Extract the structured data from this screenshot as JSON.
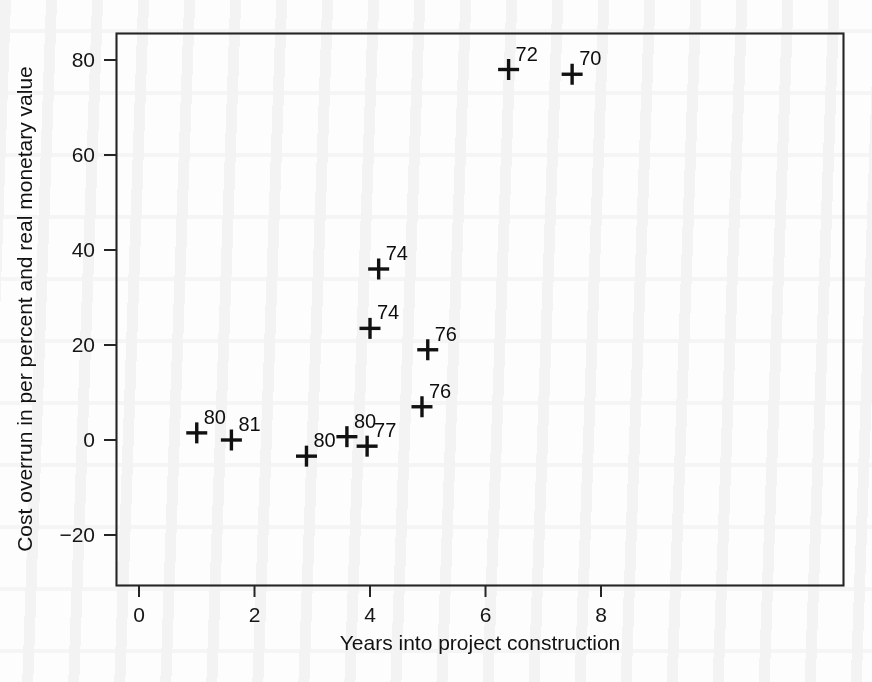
{
  "chart_data": {
    "type": "scatter",
    "title": "",
    "xlabel": "Years into project construction",
    "ylabel": "Cost overrun in per percent and real monetary value",
    "xlim": [
      -0.6,
      8.6
    ],
    "ylim": [
      -26,
      86
    ],
    "xticks": [
      0,
      2,
      4,
      6,
      8
    ],
    "xtick_labels": [
      "0",
      "2",
      "4",
      "6",
      "8"
    ],
    "yticks": [
      -20,
      0,
      20,
      40,
      60,
      80
    ],
    "ytick_labels": [
      "-20",
      "0",
      "20",
      "40",
      "60",
      "80"
    ],
    "grid": false,
    "legend": false,
    "marker": "plus",
    "point_label_position": "upper-right",
    "points": [
      {
        "label": "80",
        "x": 1.0,
        "y": 1.5
      },
      {
        "label": "81",
        "x": 1.6,
        "y": 0.0
      },
      {
        "label": "80",
        "x": 2.9,
        "y": -3.4
      },
      {
        "label": "80",
        "x": 3.6,
        "y": 0.7
      },
      {
        "label": "77",
        "x": 3.95,
        "y": -1.3
      },
      {
        "label": "74",
        "x": 4.0,
        "y": 23.5
      },
      {
        "label": "74",
        "x": 4.15,
        "y": 36.0
      },
      {
        "label": "76",
        "x": 5.0,
        "y": 19.0
      },
      {
        "label": "76",
        "x": 4.9,
        "y": 7.0
      },
      {
        "label": "72",
        "x": 6.4,
        "y": 78.0
      },
      {
        "label": "70",
        "x": 7.5,
        "y": 77.0
      }
    ]
  },
  "colors": {
    "marker": "#111111",
    "axis": "#252525",
    "text": "#121212",
    "background": "#ffffff"
  }
}
